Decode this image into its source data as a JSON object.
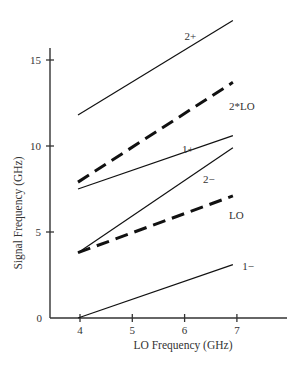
{
  "chart_data": {
    "type": "line",
    "title": "",
    "xlabel": "LO Frequency (GHz)",
    "ylabel": "Signal Frequency (GHz)",
    "xlim": [
      3.4,
      7.9
    ],
    "ylim": [
      0,
      15.6
    ],
    "xticks": [
      4,
      5,
      6,
      7
    ],
    "yticks": [
      0,
      5,
      10,
      15
    ],
    "grid": false,
    "legend": "inline labels at line ends",
    "series": [
      {
        "name": "2+",
        "style": "solid",
        "x": [
          4,
          7
        ],
        "y": [
          11.8,
          17.3
        ],
        "label_pos": [
          6.0,
          16.4
        ]
      },
      {
        "name": "2*LO",
        "style": "dashed",
        "x": [
          4,
          7
        ],
        "y": [
          7.9,
          13.7
        ],
        "label_pos": [
          6.85,
          12.3
        ]
      },
      {
        "name": "1+",
        "style": "solid",
        "x": [
          4,
          7
        ],
        "y": [
          7.5,
          10.6
        ],
        "label_pos": [
          5.95,
          9.8
        ]
      },
      {
        "name": "2−",
        "style": "solid",
        "x": [
          4,
          7
        ],
        "y": [
          3.8,
          9.9
        ],
        "label_pos": [
          6.35,
          8.1
        ]
      },
      {
        "name": "LO",
        "style": "dashed",
        "x": [
          4,
          7
        ],
        "y": [
          3.8,
          7.1
        ],
        "label_pos": [
          6.85,
          6.0
        ]
      },
      {
        "name": "1−",
        "style": "solid",
        "x": [
          4,
          7
        ],
        "y": [
          0.0,
          3.1
        ],
        "label_pos": [
          7.1,
          3.0
        ]
      }
    ]
  }
}
